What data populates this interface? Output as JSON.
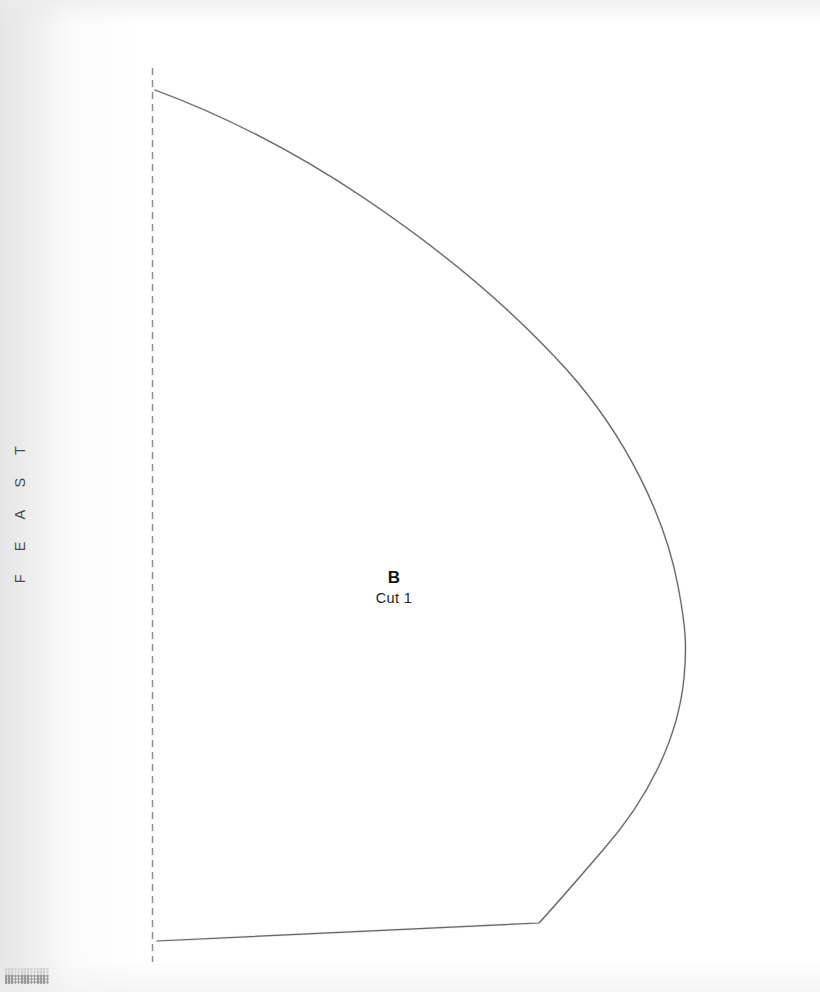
{
  "page": {
    "background_color": "#ffffff",
    "width": 820,
    "height": 992
  },
  "running_head": {
    "text": "F E A S T",
    "orientation": "vertical-rotated-90-ccw",
    "color": "#4a4a4a"
  },
  "pattern": {
    "piece_letter": "B",
    "cut_instruction": "Cut 1",
    "line_color": "#5a5a5a",
    "fold_line": {
      "icon": "dashed-fold-line-icon",
      "style": "dashed",
      "color": "#8c8c8c",
      "x": 152,
      "y_start": 68,
      "y_end": 962,
      "dash": "7 5"
    },
    "outline": {
      "description": "quarter-circle style curved pattern piece with straight bottom hem",
      "top_point": [
        155,
        90
      ],
      "right_apex": [
        686,
        640
      ],
      "bottom_vertex": [
        539,
        923
      ],
      "bottom_left_point": [
        157,
        941
      ],
      "path": "M 155 90 C 300 145 470 265 590 365 C 660 425 687 545 686 640 C 684 730 640 840 539 923 L 157 941"
    }
  }
}
